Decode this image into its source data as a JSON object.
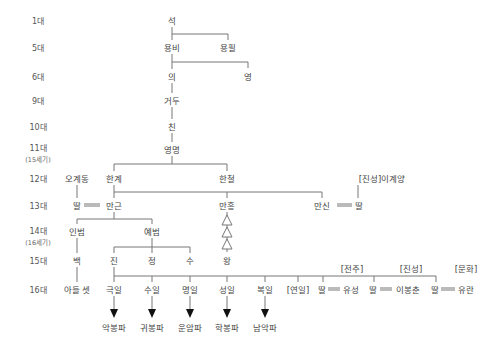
{
  "generations": [
    {
      "label": "1대",
      "y": 20
    },
    {
      "label": "5대",
      "y": 47
    },
    {
      "label": "6대",
      "y": 76
    },
    {
      "label": "9대",
      "y": 100
    },
    {
      "label": "10대",
      "y": 126
    },
    {
      "label": "11대",
      "y": 147,
      "century": "(15세기)"
    },
    {
      "label": "12대",
      "y": 178
    },
    {
      "label": "13대",
      "y": 205
    },
    {
      "label": "14대",
      "y": 230,
      "century": "(16세기)"
    },
    {
      "label": "15대",
      "y": 260
    },
    {
      "label": "16대",
      "y": 289
    }
  ],
  "people": {
    "seok": "석",
    "yongbi": "용비",
    "yongpil": "용필",
    "ui": "의",
    "yeong": "영",
    "geodu": "거두",
    "chin": "친",
    "yeongmyeong": "영명",
    "ogyedong": "오계동",
    "hangye": "한계",
    "hancheol": "한철",
    "igyeyang": "[진성]이계양",
    "ttal_oh": "딸",
    "mangeun": "만근",
    "manheung": "만흥",
    "mansin": "만신",
    "ttal_lee": "딸",
    "inbeom": "인범",
    "yebeom": "예범",
    "baek": "백",
    "jin": "진",
    "jeong": "정",
    "su": "수",
    "wang": "왕",
    "adeul_set": "아들 셋",
    "geugil": "극일",
    "suil": "수일",
    "myeongil": "명일",
    "seongil": "성일",
    "bogil": "복일",
    "yeonil": "[연일]",
    "ttal1": "딸",
    "yuseong": "유성",
    "ttal2": "딸",
    "ibongchun": "이봉춘",
    "ttal3": "딸",
    "yuran": "유란"
  },
  "clans": {
    "jeonju": "[전주]",
    "jinseong": "[진성]",
    "munhwa": "[문화]"
  },
  "branches": {
    "akbongpa": "악봉파",
    "gwibongpa": "귀봉파",
    "unampa": "운암파",
    "hakbongpa": "학봉파",
    "namakpa": "남악파"
  },
  "colors": {
    "line": "#777777",
    "text": "#444444",
    "arrow": "#111111"
  }
}
